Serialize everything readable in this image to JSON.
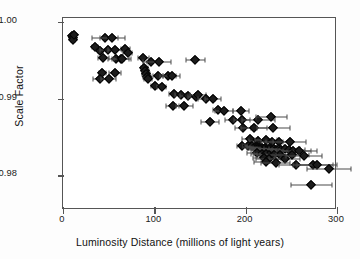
{
  "chart_data": {
    "type": "scatter",
    "title": "",
    "xlabel": "Luminosity Distance (millions of light years)",
    "ylabel": "Scale Factor",
    "xlim": [
      0,
      300
    ],
    "ylim": [
      0.9755,
      1.0005
    ],
    "xticks": [
      0,
      100,
      200,
      300
    ],
    "xtick_labels": [
      "0",
      "100",
      "200",
      "300"
    ],
    "yticks": [
      0.98,
      0.99,
      1.0
    ],
    "ytick_labels": [
      "0.98",
      "0.99",
      "1.00"
    ],
    "grid": false,
    "legend": null,
    "marker": "diamond",
    "error_bars": "horizontal (x-error)",
    "series": [
      {
        "name": "Type Ia supernovae",
        "points": [
          {
            "x": 10,
            "y": 0.9982,
            "xerr": 2
          },
          {
            "x": 11,
            "y": 0.9979,
            "xerr": 2
          },
          {
            "x": 11,
            "y": 0.9976,
            "xerr": 2
          },
          {
            "x": 12,
            "y": 0.9983,
            "xerr": 2
          },
          {
            "x": 46,
            "y": 0.9979,
            "xerr": 14
          },
          {
            "x": 54,
            "y": 0.9979,
            "xerr": 14
          },
          {
            "x": 35,
            "y": 0.9967,
            "xerr": 3
          },
          {
            "x": 41,
            "y": 0.9962,
            "xerr": 3
          },
          {
            "x": 49,
            "y": 0.9963,
            "xerr": 8
          },
          {
            "x": 57,
            "y": 0.9963,
            "xerr": 8
          },
          {
            "x": 68,
            "y": 0.9965,
            "xerr": 5
          },
          {
            "x": 71,
            "y": 0.996,
            "xerr": 5
          },
          {
            "x": 44,
            "y": 0.9953,
            "xerr": 6
          },
          {
            "x": 58,
            "y": 0.9952,
            "xerr": 9
          },
          {
            "x": 63,
            "y": 0.9951,
            "xerr": 9
          },
          {
            "x": 65,
            "y": 0.9951,
            "xerr": 9
          },
          {
            "x": 43,
            "y": 0.9934,
            "xerr": 4
          },
          {
            "x": 57,
            "y": 0.9933,
            "xerr": 7
          },
          {
            "x": 41,
            "y": 0.9925,
            "xerr": 8
          },
          {
            "x": 50,
            "y": 0.9925,
            "xerr": 8
          },
          {
            "x": 88,
            "y": 0.9953,
            "xerr": 6
          },
          {
            "x": 96,
            "y": 0.9948,
            "xerr": 8
          },
          {
            "x": 105,
            "y": 0.9948,
            "xerr": 13
          },
          {
            "x": 89,
            "y": 0.994,
            "xerr": 4
          },
          {
            "x": 90,
            "y": 0.9936,
            "xerr": 4
          },
          {
            "x": 91,
            "y": 0.9932,
            "xerr": 4
          },
          {
            "x": 92,
            "y": 0.9928,
            "xerr": 4
          },
          {
            "x": 93,
            "y": 0.9925,
            "xerr": 4
          },
          {
            "x": 104,
            "y": 0.9929,
            "xerr": 6
          },
          {
            "x": 115,
            "y": 0.9929,
            "xerr": 9
          },
          {
            "x": 119,
            "y": 0.9929,
            "xerr": 9
          },
          {
            "x": 101,
            "y": 0.9916,
            "xerr": 5
          },
          {
            "x": 108,
            "y": 0.9915,
            "xerr": 5
          },
          {
            "x": 145,
            "y": 0.995,
            "xerr": 10
          },
          {
            "x": 122,
            "y": 0.9906,
            "xerr": 6
          },
          {
            "x": 129,
            "y": 0.9905,
            "xerr": 6
          },
          {
            "x": 137,
            "y": 0.9903,
            "xerr": 9
          },
          {
            "x": 146,
            "y": 0.9902,
            "xerr": 9
          },
          {
            "x": 148,
            "y": 0.9905,
            "xerr": 9
          },
          {
            "x": 120,
            "y": 0.9891,
            "xerr": 7
          },
          {
            "x": 133,
            "y": 0.989,
            "xerr": 9
          },
          {
            "x": 157,
            "y": 0.9899,
            "xerr": 9
          },
          {
            "x": 164,
            "y": 0.9899,
            "xerr": 9
          },
          {
            "x": 170,
            "y": 0.9885,
            "xerr": 6
          },
          {
            "x": 176,
            "y": 0.9884,
            "xerr": 10
          },
          {
            "x": 195,
            "y": 0.9884,
            "xerr": 9
          },
          {
            "x": 161,
            "y": 0.9869,
            "xerr": 10
          },
          {
            "x": 186,
            "y": 0.9872,
            "xerr": 9
          },
          {
            "x": 196,
            "y": 0.9872,
            "xerr": 9
          },
          {
            "x": 214,
            "y": 0.9872,
            "xerr": 18
          },
          {
            "x": 228,
            "y": 0.9876,
            "xerr": 17
          },
          {
            "x": 197,
            "y": 0.9862,
            "xerr": 9
          },
          {
            "x": 209,
            "y": 0.9862,
            "xerr": 14
          },
          {
            "x": 230,
            "y": 0.9862,
            "xerr": 18
          },
          {
            "x": 205,
            "y": 0.9848,
            "xerr": 9
          },
          {
            "x": 214,
            "y": 0.9845,
            "xerr": 10
          },
          {
            "x": 222,
            "y": 0.9846,
            "xerr": 12
          },
          {
            "x": 229,
            "y": 0.9843,
            "xerr": 12
          },
          {
            "x": 236,
            "y": 0.9844,
            "xerr": 14
          },
          {
            "x": 248,
            "y": 0.9844,
            "xerr": 18
          },
          {
            "x": 196,
            "y": 0.9838,
            "xerr": 6
          },
          {
            "x": 203,
            "y": 0.9838,
            "xerr": 6
          },
          {
            "x": 207,
            "y": 0.9838,
            "xerr": 8
          },
          {
            "x": 210,
            "y": 0.9837,
            "xerr": 8
          },
          {
            "x": 212,
            "y": 0.9837,
            "xerr": 10
          },
          {
            "x": 214,
            "y": 0.9836,
            "xerr": 10
          },
          {
            "x": 216,
            "y": 0.9836,
            "xerr": 11
          },
          {
            "x": 217,
            "y": 0.9835,
            "xerr": 11
          },
          {
            "x": 218,
            "y": 0.9836,
            "xerr": 12
          },
          {
            "x": 219,
            "y": 0.9835,
            "xerr": 12
          },
          {
            "x": 220,
            "y": 0.9834,
            "xerr": 12
          },
          {
            "x": 221,
            "y": 0.9836,
            "xerr": 13
          },
          {
            "x": 222,
            "y": 0.9834,
            "xerr": 13
          },
          {
            "x": 223,
            "y": 0.9835,
            "xerr": 13
          },
          {
            "x": 224,
            "y": 0.9833,
            "xerr": 14
          },
          {
            "x": 225,
            "y": 0.9835,
            "xerr": 14
          },
          {
            "x": 226,
            "y": 0.9834,
            "xerr": 14
          },
          {
            "x": 227,
            "y": 0.9833,
            "xerr": 15
          },
          {
            "x": 228,
            "y": 0.9835,
            "xerr": 15
          },
          {
            "x": 229,
            "y": 0.9833,
            "xerr": 15
          },
          {
            "x": 231,
            "y": 0.9834,
            "xerr": 15
          },
          {
            "x": 233,
            "y": 0.9833,
            "xerr": 16
          },
          {
            "x": 236,
            "y": 0.9834,
            "xerr": 16
          },
          {
            "x": 239,
            "y": 0.9833,
            "xerr": 17
          },
          {
            "x": 243,
            "y": 0.9834,
            "xerr": 17
          },
          {
            "x": 247,
            "y": 0.9833,
            "xerr": 18
          },
          {
            "x": 252,
            "y": 0.9832,
            "xerr": 19
          },
          {
            "x": 258,
            "y": 0.9832,
            "xerr": 20
          },
          {
            "x": 212,
            "y": 0.9829,
            "xerr": 10
          },
          {
            "x": 218,
            "y": 0.9828,
            "xerr": 12
          },
          {
            "x": 222,
            "y": 0.9828,
            "xerr": 13
          },
          {
            "x": 226,
            "y": 0.9827,
            "xerr": 14
          },
          {
            "x": 231,
            "y": 0.9827,
            "xerr": 15
          },
          {
            "x": 238,
            "y": 0.9827,
            "xerr": 16
          },
          {
            "x": 220,
            "y": 0.9823,
            "xerr": 12
          },
          {
            "x": 225,
            "y": 0.9822,
            "xerr": 14
          },
          {
            "x": 243,
            "y": 0.9822,
            "xerr": 17
          },
          {
            "x": 251,
            "y": 0.9826,
            "xerr": 18
          },
          {
            "x": 264,
            "y": 0.9825,
            "xerr": 20
          },
          {
            "x": 222,
            "y": 0.9817,
            "xerr": 13
          },
          {
            "x": 233,
            "y": 0.9816,
            "xerr": 16
          },
          {
            "x": 255,
            "y": 0.9813,
            "xerr": 19
          },
          {
            "x": 274,
            "y": 0.9814,
            "xerr": 22
          },
          {
            "x": 278,
            "y": 0.9813,
            "xerr": 22
          },
          {
            "x": 291,
            "y": 0.9808,
            "xerr": 24
          },
          {
            "x": 272,
            "y": 0.9787,
            "xerr": 22
          }
        ]
      }
    ]
  }
}
